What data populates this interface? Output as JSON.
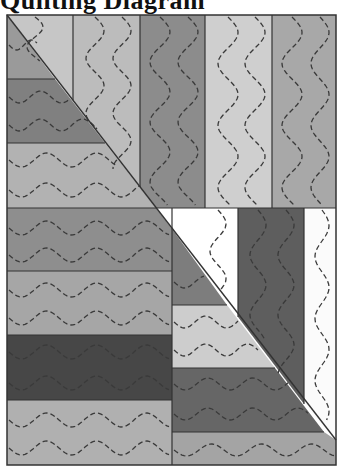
{
  "title": "Quilting Diagram",
  "frame": {
    "x": 7,
    "y": 15,
    "w": 329,
    "h": 450,
    "stroke": "#333333"
  },
  "stitch": {
    "color": "#3a3a3a",
    "dash": "5 3"
  },
  "diagonal": {
    "x1": 7,
    "y1": 15,
    "x2": 336,
    "y2": 440
  },
  "patches": [
    {
      "name": "top-col-1-right",
      "pts": "7,15 73,15 73,100",
      "fill": "#c6c6c6",
      "dir": "v"
    },
    {
      "name": "top-col-2",
      "pts": "73,15 140,15 140,187 73,100",
      "fill": "#bcbcbc",
      "dir": "v"
    },
    {
      "name": "top-col-3",
      "pts": "140,15 205,15 205,208 156,208 140,187",
      "fill": "#8c8c8c",
      "dir": "v"
    },
    {
      "name": "top-col-4",
      "pts": "205,15 272,15 272,208 205,208",
      "fill": "#cfcfcf",
      "dir": "v"
    },
    {
      "name": "top-col-5",
      "pts": "272,15 336,15 336,208 272,208",
      "fill": "#a8a8a8",
      "dir": "v"
    },
    {
      "name": "upper-left-strip-1",
      "pts": "7,15 55,79 7,79",
      "fill": "#9a9a9a",
      "dir": "h"
    },
    {
      "name": "upper-left-strip-2",
      "pts": "7,79 55,79 105,143 7,143",
      "fill": "#808080",
      "dir": "h"
    },
    {
      "name": "upper-left-strip-3",
      "pts": "7,143 105,143 156,208 7,208",
      "fill": "#b2b2b2",
      "dir": "h"
    },
    {
      "name": "lower-left-strip-1",
      "pts": "7,208 172,208 172,271 7,271",
      "fill": "#8e8e8e",
      "dir": "h"
    },
    {
      "name": "lower-left-strip-2",
      "pts": "7,271 172,271 172,335 7,335",
      "fill": "#a6a6a6",
      "dir": "h"
    },
    {
      "name": "lower-left-strip-3",
      "pts": "7,335 172,335 172,400 7,400",
      "fill": "#474747",
      "dir": "h"
    },
    {
      "name": "lower-left-strip-4",
      "pts": "7,400 172,400 172,465 7,465",
      "fill": "#b0b0b0",
      "dir": "h"
    },
    {
      "name": "lower-right-white-triangle",
      "pts": "156,208 238,208 238,317",
      "fill": "#ffffff",
      "dir": "v"
    },
    {
      "name": "lower-right-dark-column",
      "pts": "238,208 304,208 304,404 238,317",
      "fill": "#5e5e5e",
      "dir": "v"
    },
    {
      "name": "lower-right-white-column",
      "pts": "304,208 336,208 336,440 304,404",
      "fill": "#fbfbfb",
      "dir": "v"
    },
    {
      "name": "lower-right-strip-1",
      "pts": "172,229 227,305 172,305",
      "fill": "#7d7d7d",
      "dir": "h"
    },
    {
      "name": "lower-right-strip-2",
      "pts": "172,305 227,305 275,368 172,368",
      "fill": "#cdcdcd",
      "dir": "h"
    },
    {
      "name": "lower-right-strip-3",
      "pts": "172,368 275,368 324,432 172,432",
      "fill": "#666666",
      "dir": "h"
    },
    {
      "name": "lower-right-strip-4",
      "pts": "172,432 324,432 336,440 336,465 172,465",
      "fill": "#a4a4a4",
      "dir": "h"
    }
  ],
  "seams": [
    [
      73,
      15,
      73,
      100
    ],
    [
      140,
      15,
      140,
      187
    ],
    [
      205,
      15,
      205,
      208
    ],
    [
      272,
      15,
      272,
      208
    ],
    [
      7,
      79,
      55,
      79
    ],
    [
      7,
      143,
      105,
      143
    ],
    [
      7,
      208,
      336,
      208
    ],
    [
      7,
      271,
      172,
      271
    ],
    [
      7,
      335,
      172,
      335
    ],
    [
      7,
      400,
      172,
      400
    ],
    [
      172,
      208,
      172,
      465
    ],
    [
      238,
      208,
      238,
      317
    ],
    [
      304,
      208,
      304,
      404
    ],
    [
      172,
      305,
      227,
      305
    ],
    [
      172,
      368,
      275,
      368
    ],
    [
      172,
      432,
      324,
      432
    ]
  ],
  "quilting_lines": [
    {
      "type": "v",
      "x": 35,
      "y1": 17,
      "y2": 62,
      "amp": 8,
      "period": 40
    },
    {
      "type": "v",
      "x": 95,
      "y1": 17,
      "y2": 130,
      "amp": 9,
      "period": 55
    },
    {
      "type": "v",
      "x": 122,
      "y1": 17,
      "y2": 170,
      "amp": 9,
      "period": 55
    },
    {
      "type": "v",
      "x": 160,
      "y1": 17,
      "y2": 206,
      "amp": 10,
      "period": 60
    },
    {
      "type": "v",
      "x": 188,
      "y1": 17,
      "y2": 206,
      "amp": 10,
      "period": 60
    },
    {
      "type": "v",
      "x": 228,
      "y1": 17,
      "y2": 206,
      "amp": 10,
      "period": 62
    },
    {
      "type": "v",
      "x": 255,
      "y1": 17,
      "y2": 206,
      "amp": 10,
      "period": 62
    },
    {
      "type": "v",
      "x": 292,
      "y1": 17,
      "y2": 206,
      "amp": 10,
      "period": 62
    },
    {
      "type": "v",
      "x": 320,
      "y1": 17,
      "y2": 206,
      "amp": 9,
      "period": 62
    },
    {
      "type": "h",
      "y": 45,
      "x1": 9,
      "x2": 38,
      "amp": 5,
      "period": 30
    },
    {
      "type": "h",
      "y": 97,
      "x1": 9,
      "x2": 70,
      "amp": 6,
      "period": 42
    },
    {
      "type": "h",
      "y": 125,
      "x1": 9,
      "x2": 95,
      "amp": 6,
      "period": 42
    },
    {
      "type": "h",
      "y": 160,
      "x1": 9,
      "x2": 118,
      "amp": 7,
      "period": 50
    },
    {
      "type": "h",
      "y": 190,
      "x1": 9,
      "x2": 140,
      "amp": 7,
      "period": 50
    },
    {
      "type": "h",
      "y": 228,
      "x1": 9,
      "x2": 170,
      "amp": 7,
      "period": 50
    },
    {
      "type": "h",
      "y": 255,
      "x1": 9,
      "x2": 170,
      "amp": 7,
      "period": 50
    },
    {
      "type": "h",
      "y": 290,
      "x1": 9,
      "x2": 170,
      "amp": 7,
      "period": 50
    },
    {
      "type": "h",
      "y": 318,
      "x1": 9,
      "x2": 170,
      "amp": 7,
      "period": 50
    },
    {
      "type": "h",
      "y": 352,
      "x1": 9,
      "x2": 170,
      "amp": 7,
      "period": 50
    },
    {
      "type": "h",
      "y": 383,
      "x1": 9,
      "x2": 170,
      "amp": 7,
      "period": 50
    },
    {
      "type": "h",
      "y": 420,
      "x1": 9,
      "x2": 170,
      "amp": 7,
      "period": 50
    },
    {
      "type": "h",
      "y": 448,
      "x1": 9,
      "x2": 170,
      "amp": 7,
      "period": 50
    },
    {
      "type": "v",
      "x": 218,
      "y1": 210,
      "y2": 290,
      "amp": 8,
      "period": 55
    },
    {
      "type": "v",
      "x": 258,
      "y1": 210,
      "y2": 340,
      "amp": 8,
      "period": 60
    },
    {
      "type": "v",
      "x": 286,
      "y1": 210,
      "y2": 375,
      "amp": 8,
      "period": 60
    },
    {
      "type": "v",
      "x": 322,
      "y1": 210,
      "y2": 420,
      "amp": 7,
      "period": 62
    },
    {
      "type": "h",
      "y": 282,
      "x1": 174,
      "x2": 205,
      "amp": 6,
      "period": 42
    },
    {
      "type": "h",
      "y": 322,
      "x1": 174,
      "x2": 238,
      "amp": 6,
      "period": 42
    },
    {
      "type": "h",
      "y": 350,
      "x1": 174,
      "x2": 258,
      "amp": 6,
      "period": 42
    },
    {
      "type": "h",
      "y": 384,
      "x1": 174,
      "x2": 288,
      "amp": 6,
      "period": 45
    },
    {
      "type": "h",
      "y": 414,
      "x1": 174,
      "x2": 308,
      "amp": 6,
      "period": 45
    },
    {
      "type": "h",
      "y": 450,
      "x1": 174,
      "x2": 334,
      "amp": 6,
      "period": 50
    }
  ]
}
